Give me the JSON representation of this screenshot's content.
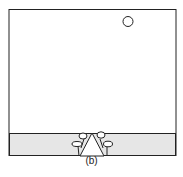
{
  "figure": {
    "caption": "(b)",
    "colors": {
      "frame": "#222222",
      "ground": "#e6e6e6",
      "background": "#ffffff"
    },
    "elements": {
      "sun": "circle-icon",
      "ground": "ground-strip",
      "tent": "triangle-shape",
      "trees": [
        "tree-left-upper",
        "tree-left-lower",
        "tree-right-upper",
        "tree-right-lower"
      ]
    }
  }
}
